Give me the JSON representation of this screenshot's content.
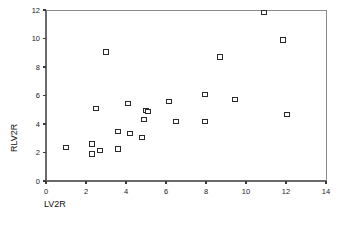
{
  "chart_data": {
    "type": "scatter",
    "title": "",
    "xlabel": "LV2R",
    "ylabel": "RLV2R",
    "xlim": [
      0,
      14
    ],
    "ylim": [
      0,
      12
    ],
    "xticks": [
      0,
      2,
      4,
      6,
      8,
      10,
      12,
      14
    ],
    "yticks": [
      0,
      2,
      4,
      6,
      8,
      10,
      12
    ],
    "grid": false,
    "legend": null,
    "marker_style": "open-square",
    "marker_color": "#2a2a2a",
    "points": [
      {
        "x": 1.0,
        "y": 2.35
      },
      {
        "x": 2.3,
        "y": 2.6
      },
      {
        "x": 2.3,
        "y": 1.9
      },
      {
        "x": 2.5,
        "y": 5.1
      },
      {
        "x": 2.7,
        "y": 2.15
      },
      {
        "x": 3.0,
        "y": 9.05
      },
      {
        "x": 3.6,
        "y": 3.45
      },
      {
        "x": 3.6,
        "y": 2.25
      },
      {
        "x": 4.1,
        "y": 5.45
      },
      {
        "x": 4.2,
        "y": 3.35
      },
      {
        "x": 4.8,
        "y": 3.05
      },
      {
        "x": 4.9,
        "y": 4.3
      },
      {
        "x": 5.0,
        "y": 4.95
      },
      {
        "x": 5.1,
        "y": 4.9
      },
      {
        "x": 6.15,
        "y": 5.6
      },
      {
        "x": 6.5,
        "y": 4.15
      },
      {
        "x": 7.95,
        "y": 6.05
      },
      {
        "x": 7.95,
        "y": 4.15
      },
      {
        "x": 8.7,
        "y": 8.7
      },
      {
        "x": 9.45,
        "y": 5.7
      },
      {
        "x": 10.9,
        "y": 11.8
      },
      {
        "x": 11.85,
        "y": 9.9
      },
      {
        "x": 12.05,
        "y": 4.65
      }
    ]
  },
  "axes": {
    "x_title": "LV2R",
    "y_title": "RLV2R"
  }
}
